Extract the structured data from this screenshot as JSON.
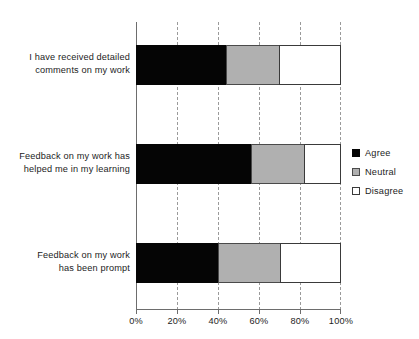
{
  "chart_data": {
    "type": "bar",
    "orientation": "horizontal",
    "stacked": true,
    "normalized": true,
    "title": "",
    "subtitle": "",
    "xlabel": "",
    "ylabel": "",
    "xlim": [
      0,
      100
    ],
    "xticks": [
      0,
      20,
      40,
      60,
      80,
      100
    ],
    "xtick_labels": [
      "0%",
      "20%",
      "40%",
      "60%",
      "80%",
      "100%"
    ],
    "grid": true,
    "grid_axis": "x",
    "grid_style": "dashed",
    "legend_position": "right",
    "categories": [
      "I have received detailed\ncomments on my work",
      "Feedback on my work has\nhelped me in my learning",
      "Feedback on my work\nhas been prompt"
    ],
    "series": [
      {
        "name": "Agree",
        "color": "#050505",
        "values": [
          44,
          56,
          40
        ]
      },
      {
        "name": "Neutral",
        "color": "#b0b0b0",
        "values": [
          26,
          26,
          30
        ]
      },
      {
        "name": "Disagree",
        "color": "#ffffff",
        "values": [
          30,
          18,
          30
        ]
      }
    ]
  },
  "legend": {
    "items": [
      {
        "label": "Agree"
      },
      {
        "label": "Neutral"
      },
      {
        "label": "Disagree"
      }
    ]
  },
  "axis": {
    "tick_labels": [
      "0%",
      "20%",
      "40%",
      "60%",
      "80%",
      "100%"
    ]
  },
  "categories": {
    "labels": [
      "I have received detailed\ncomments on my work",
      "Feedback on my work has\nhelped me in my learning",
      "Feedback on my work\nhas been prompt"
    ]
  }
}
